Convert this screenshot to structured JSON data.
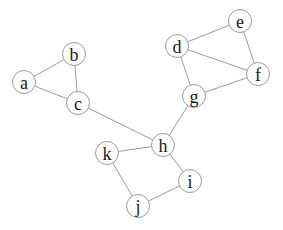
{
  "diagram": {
    "type": "undirected-graph",
    "background_color": "#ffffff",
    "node_fill_color": "#ffffff",
    "node_stroke_color": "#9a9a9a",
    "edge_color": "#9a9a9a",
    "label_color": "#1a1a1a",
    "nodes": [
      {
        "id": "a",
        "label": "a",
        "x": 24,
        "y": 82
      },
      {
        "id": "b",
        "label": "b",
        "x": 74,
        "y": 54
      },
      {
        "id": "c",
        "label": "c",
        "x": 78,
        "y": 103
      },
      {
        "id": "d",
        "label": "d",
        "x": 177,
        "y": 46
      },
      {
        "id": "e",
        "label": "e",
        "x": 240,
        "y": 21
      },
      {
        "id": "f",
        "label": "f",
        "x": 258,
        "y": 74
      },
      {
        "id": "g",
        "label": "g",
        "x": 194,
        "y": 96
      },
      {
        "id": "h",
        "label": "h",
        "x": 163,
        "y": 145
      },
      {
        "id": "i",
        "label": "i",
        "x": 190,
        "y": 181
      },
      {
        "id": "j",
        "label": "j",
        "x": 138,
        "y": 206
      },
      {
        "id": "k",
        "label": "k",
        "x": 107,
        "y": 153
      }
    ],
    "edges": [
      {
        "source": "a",
        "target": "b"
      },
      {
        "source": "a",
        "target": "c"
      },
      {
        "source": "b",
        "target": "c"
      },
      {
        "source": "c",
        "target": "h"
      },
      {
        "source": "d",
        "target": "e"
      },
      {
        "source": "d",
        "target": "f"
      },
      {
        "source": "d",
        "target": "g"
      },
      {
        "source": "e",
        "target": "f"
      },
      {
        "source": "f",
        "target": "g"
      },
      {
        "source": "g",
        "target": "h"
      },
      {
        "source": "h",
        "target": "k"
      },
      {
        "source": "h",
        "target": "i"
      },
      {
        "source": "k",
        "target": "j"
      },
      {
        "source": "j",
        "target": "i"
      }
    ]
  }
}
